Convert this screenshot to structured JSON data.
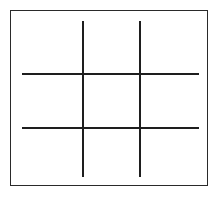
{
  "diagram": {
    "type": "tic-tac-toe grid",
    "colors": {
      "line": "#1e1e1e",
      "frame": "#2a2a2a",
      "background": "#ffffff"
    },
    "frame": {
      "x": 10,
      "y": 10,
      "width": 198,
      "height": 176
    },
    "vertical_lines": [
      {
        "x": 82,
        "y1": 21,
        "y2": 177
      },
      {
        "x": 139,
        "y1": 21,
        "y2": 177
      }
    ],
    "horizontal_lines": [
      {
        "y": 73,
        "x1": 22,
        "x2": 199
      },
      {
        "y": 127,
        "x1": 22,
        "x2": 199
      }
    ],
    "cells": [
      [
        "",
        "",
        ""
      ],
      [
        "",
        "",
        ""
      ],
      [
        "",
        "",
        ""
      ]
    ]
  }
}
